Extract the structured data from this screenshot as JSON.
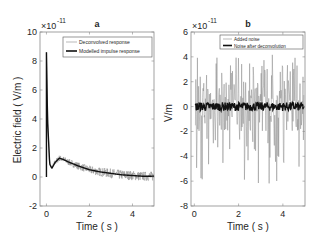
{
  "chart_data": [
    {
      "panel": "a",
      "type": "line",
      "title": "a",
      "xlabel": "Time ( s )",
      "ylabel": "Electric field ( V/m )",
      "y_exponent": "×10^-11",
      "xlim": [
        -0.3,
        5
      ],
      "ylim": [
        -2,
        10
      ],
      "xticks": [
        0,
        2,
        4
      ],
      "yticks": [
        -2,
        0,
        2,
        4,
        6,
        8,
        10
      ],
      "grid": false,
      "legend_position": "upper right",
      "legend": [
        "Deconvolved response",
        "Modelled impulse response"
      ],
      "series": [
        {
          "name": "Deconvolved response",
          "style": "thin gray noisy line",
          "x": [
            0,
            0.05,
            0.15,
            0.25,
            0.4,
            0.6,
            0.8,
            1.0,
            1.5,
            2.0,
            2.5,
            3.0,
            3.5,
            4.0,
            4.5,
            5.0
          ],
          "y": [
            8.6,
            4.0,
            0.9,
            0.6,
            1.0,
            1.3,
            1.2,
            1.05,
            0.75,
            0.5,
            0.35,
            0.25,
            0.15,
            0.1,
            0.05,
            0.05
          ]
        },
        {
          "name": "Modelled impulse response",
          "style": "thick black line",
          "x": [
            0,
            0.05,
            0.15,
            0.25,
            0.4,
            0.6,
            0.8,
            1.0,
            1.5,
            2.0,
            2.5,
            3.0,
            3.5,
            4.0,
            4.5,
            5.0
          ],
          "y": [
            8.6,
            4.0,
            0.9,
            0.6,
            1.0,
            1.3,
            1.2,
            1.05,
            0.75,
            0.5,
            0.35,
            0.25,
            0.15,
            0.1,
            0.05,
            0.05
          ]
        }
      ]
    },
    {
      "panel": "b",
      "type": "line",
      "title": "b",
      "xlabel": "Time ( s )",
      "ylabel": "V/m",
      "y_exponent": "×10^-11",
      "xlim": [
        -0.15,
        5
      ],
      "ylim": [
        -8,
        6
      ],
      "xticks": [
        0,
        2,
        4
      ],
      "yticks": [
        -8,
        -6,
        -4,
        -2,
        0,
        2,
        4,
        6
      ],
      "grid": false,
      "legend_position": "upper right",
      "legend": [
        "Added noise",
        "Noise after deconvolution"
      ],
      "series": [
        {
          "name": "Added noise",
          "style": "thin gray line, random noise",
          "range_min": -6.3,
          "range_max": 4.3,
          "typical_positive_peak": 3.5,
          "typical_negative_peak": -4.5
        },
        {
          "name": "Noise after deconvolution",
          "style": "thick black line near zero",
          "range_min": -0.4,
          "range_max": 0.3,
          "mean": 0
        }
      ]
    }
  ],
  "panels": {
    "a": {
      "title": "a",
      "exponent_base": "×10",
      "exponent_power": "-11",
      "xlabel": "Time ( s )",
      "ylabel": "Electric field ( V/m )",
      "ytick_labels": [
        "10",
        "8",
        "6",
        "4",
        "2",
        "0",
        "-2"
      ],
      "xtick_labels": [
        "0",
        "2",
        "4"
      ],
      "legend": [
        "Deconvolved response",
        "Modelled impulse response"
      ]
    },
    "b": {
      "title": "b",
      "exponent_base": "×10",
      "exponent_power": "-11",
      "xlabel": "Time ( s )",
      "ylabel": "V/m",
      "ytick_labels": [
        "6",
        "4",
        "2",
        "0",
        "-2",
        "-4",
        "-6",
        "-8"
      ],
      "xtick_labels": [
        "0",
        "2",
        "4"
      ],
      "legend": [
        "Added noise",
        "Noise after deconvolution"
      ]
    }
  },
  "colors": {
    "axis": "#7f7f7f",
    "text": "#262626",
    "thin_series": "#8c8c8c",
    "thick_series": "#111111"
  }
}
